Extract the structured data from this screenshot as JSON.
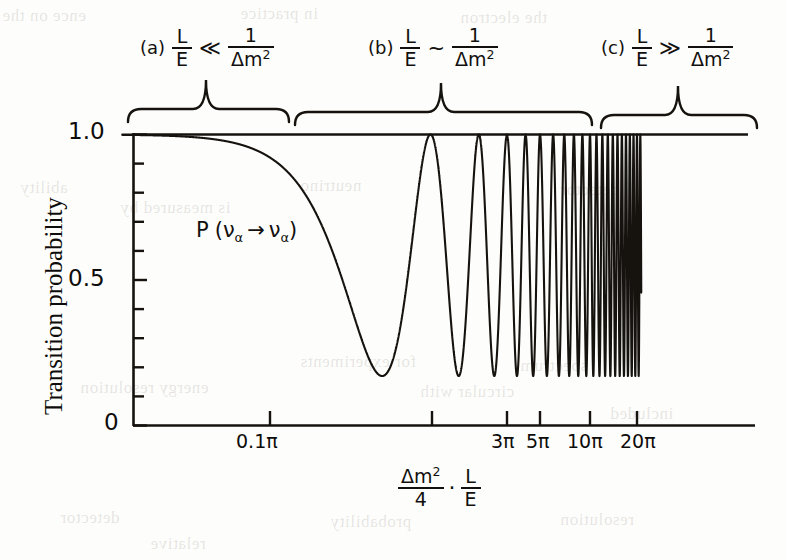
{
  "figure": {
    "kind": "scanned-textbook-figure",
    "ink_color": "#12100e",
    "paper_color": "#fdfdfb"
  },
  "regions": [
    {
      "tag": "(a)",
      "lhs_num": "L",
      "lhs_den": "E",
      "relation": "≪",
      "rhs_num": "1",
      "rhs_den": "Δm",
      "rhs_den_sup": "2",
      "brace_left": 128,
      "brace_right": 289,
      "brace_peak": 206,
      "label_x": 140,
      "label_y": 26
    },
    {
      "tag": "(b)",
      "lhs_num": "L",
      "lhs_den": "E",
      "relation": "~",
      "rhs_num": "1",
      "rhs_den": "Δm",
      "rhs_den_sup": "2",
      "brace_left": 295,
      "brace_right": 592,
      "brace_peak": 441,
      "label_x": 368,
      "label_y": 26
    },
    {
      "tag": "(c)",
      "lhs_num": "L",
      "lhs_den": "E",
      "relation": "≫",
      "rhs_num": "1",
      "rhs_den": "Δm",
      "rhs_den_sup": "2",
      "brace_left": 601,
      "brace_right": 757,
      "brace_peak": 678,
      "label_x": 601,
      "label_y": 26
    }
  ],
  "axes": {
    "y_axis_label": "Transition probability",
    "y_tick_labels": [
      "1.0",
      "0.5",
      "0"
    ],
    "x_tick_labels": [
      "0.1π",
      "3π",
      "5π",
      "10π",
      "20π"
    ],
    "x_caption_num": "Δm",
    "x_caption_num_sup": "2",
    "x_caption_den": "4",
    "x_caption_dot": "·",
    "x_caption_num2": "L",
    "x_caption_den2": "E"
  },
  "annotation": {
    "probability_label": "P (να → να)",
    "p_symbol": "P",
    "open_paren": "(",
    "nu_from": "ν",
    "sub_from": "α",
    "arrow": "→",
    "nu_to": "ν",
    "sub_to": "α",
    "close_paren": ")"
  },
  "chart_data": {
    "type": "line",
    "title": "",
    "subtitle": "",
    "xlabel": "(Δm²/4)·(L/E)",
    "ylabel": "Transition probability",
    "grid": false,
    "legend": "none",
    "x_scale": "logarithmic",
    "ylim": [
      0,
      1.08
    ],
    "y_ticks_major": [
      0,
      0.5,
      1.0
    ],
    "y_ticks_minor_step": 0.1,
    "x_tick_values": [
      0.1,
      3,
      5,
      10,
      20
    ],
    "x_tick_labels": [
      "0.1π",
      "3π",
      "5π",
      "10π",
      "20π"
    ],
    "formula": "P = 1 - A*sin^2(x), A = 0.83",
    "amplitude": 0.83,
    "baseline_max": 1.0,
    "minimum_value": 0.17,
    "series": [
      {
        "name": "P(nu_alpha -> nu_alpha)",
        "description": "Survival probability: flat near 1.0 for L/E << 1/dm^2, first deep minimum (~0.17) near x = pi, then rapid oscillations between 0.17 and 1.0 that compress on the logarithmic axis and become unresolved beyond 20 pi",
        "x_in_units_of_pi": [
          0.02,
          0.05,
          0.1,
          0.2,
          0.3,
          0.4,
          0.5,
          0.6,
          0.7,
          0.8,
          0.9,
          1.0,
          1.1,
          1.2,
          1.3,
          1.5,
          1.7,
          2.0,
          2.5,
          3.0,
          3.5,
          4.0,
          5.0,
          6.0,
          7.0,
          8.0,
          10.0,
          12.0,
          15.0,
          20.0
        ],
        "y": [
          1.0,
          1.0,
          1.0,
          0.99,
          0.98,
          0.95,
          0.59,
          0.27,
          0.17,
          0.19,
          0.45,
          0.83,
          1.0,
          0.92,
          0.6,
          0.2,
          0.27,
          0.89,
          0.22,
          0.99,
          0.21,
          1.0,
          0.18,
          0.96,
          0.22,
          1.0,
          0.19,
          0.97,
          0.21,
          1.0
        ]
      }
    ],
    "annotations": [
      {
        "text": "P (να → να)",
        "x_px": 196,
        "y_px": 231
      },
      {
        "text": "(a) L/E ≪ 1/Δm²",
        "region": "a"
      },
      {
        "text": "(b) L/E ~ 1/Δm²",
        "region": "b"
      },
      {
        "text": "(c) L/E ≫ 1/Δm²",
        "region": "c"
      }
    ]
  },
  "bleed_through": [
    {
      "text": "ence on the",
      "x": 2,
      "y": 6
    },
    {
      "text": "in practice",
      "x": 240,
      "y": 4
    },
    {
      "text": "the electron",
      "x": 460,
      "y": 8
    },
    {
      "text": "ability",
      "x": 20,
      "y": 178
    },
    {
      "text": "neutrino",
      "x": 300,
      "y": 176
    },
    {
      "text": "detector",
      "x": 560,
      "y": 180
    },
    {
      "text": "is measured by",
      "x": 120,
      "y": 198
    },
    {
      "text": "for experiments",
      "x": 300,
      "y": 352
    },
    {
      "text": "spectrum",
      "x": 520,
      "y": 356
    },
    {
      "text": "energy resolution",
      "x": 80,
      "y": 378
    },
    {
      "text": "circular with",
      "x": 420,
      "y": 382
    },
    {
      "text": "included",
      "x": 610,
      "y": 404
    },
    {
      "text": "detector",
      "x": 60,
      "y": 508
    },
    {
      "text": "probability",
      "x": 330,
      "y": 512
    },
    {
      "text": "resolution",
      "x": 560,
      "y": 510
    },
    {
      "text": "relative",
      "x": 150,
      "y": 534
    }
  ]
}
